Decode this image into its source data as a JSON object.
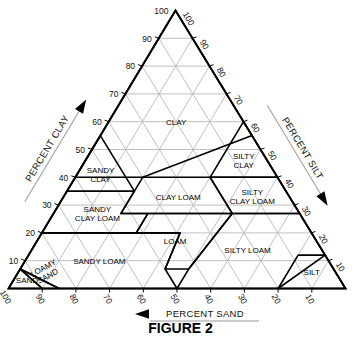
{
  "figure": {
    "caption": "FIGURE 2"
  },
  "axes": {
    "left": {
      "name": "PERCENT CLAY",
      "label": "PERCENT CLAY",
      "arrow": "up-arrow-icon",
      "ticks": [
        10,
        20,
        30,
        40,
        50,
        60,
        70,
        80,
        90,
        100
      ]
    },
    "right": {
      "name": "PERCENT SILT",
      "label": "PERCENT SILT",
      "arrow": "down-arrow-icon",
      "ticks": [
        10,
        20,
        30,
        40,
        50,
        60,
        70,
        80,
        90,
        100
      ]
    },
    "bottom": {
      "name": "PERCENT SAND",
      "label": "PERCENT SAND",
      "arrow": "left-arrow-icon",
      "ticks": [
        100,
        90,
        80,
        70,
        60,
        50,
        40,
        30,
        20,
        10
      ]
    }
  },
  "colors": {
    "outline": "#000000",
    "region_border": "#000000",
    "gridline": "#b9b9b9",
    "text": "#111111",
    "background": "#ffffff"
  },
  "chart_data": {
    "type": "diagram",
    "subtype": "ternary",
    "axis_ranges": {
      "clay": [
        0,
        100
      ],
      "silt": [
        0,
        100
      ],
      "sand": [
        0,
        100
      ]
    },
    "grid": true,
    "grid_interval": 10,
    "legend": "none",
    "classes": [
      {
        "name": "CLAY",
        "lines": [
          "CLAY"
        ],
        "centroid": {
          "clay": 60,
          "silt": 20,
          "sand": 20
        }
      },
      {
        "name": "SILTY CLAY",
        "lines": [
          "SILTY",
          "CLAY"
        ],
        "centroid": {
          "clay": 46,
          "silt": 47,
          "sand": 7
        }
      },
      {
        "name": "SANDY CLAY",
        "lines": [
          "SANDY",
          "CLAY"
        ],
        "centroid": {
          "clay": 41,
          "silt": 7,
          "sand": 52
        }
      },
      {
        "name": "CLAY LOAM",
        "lines": [
          "CLAY LOAM"
        ],
        "centroid": {
          "clay": 33,
          "silt": 34,
          "sand": 33
        }
      },
      {
        "name": "SILTY CLAY LOAM",
        "lines": [
          "SILTY",
          "CLAY LOAM"
        ],
        "centroid": {
          "clay": 33,
          "silt": 56,
          "sand": 11
        }
      },
      {
        "name": "SANDY CLAY LOAM",
        "lines": [
          "SANDY",
          "CLAY LOAM"
        ],
        "centroid": {
          "clay": 27,
          "silt": 13,
          "sand": 60
        }
      },
      {
        "name": "LOAM",
        "lines": [
          "LOAM"
        ],
        "centroid": {
          "clay": 17,
          "silt": 41,
          "sand": 42
        }
      },
      {
        "name": "SILTY LOAM",
        "lines": [
          "SILTY LOAM"
        ],
        "centroid": {
          "clay": 14,
          "silt": 64,
          "sand": 22
        }
      },
      {
        "name": "SANDY LOAM",
        "lines": [
          "SANDY LOAM"
        ],
        "centroid": {
          "clay": 10,
          "silt": 22,
          "sand": 68
        }
      },
      {
        "name": "SILT",
        "lines": [
          "SILT"
        ],
        "centroid": {
          "clay": 6,
          "silt": 87,
          "sand": 7
        }
      },
      {
        "name": "LOAMY SAND",
        "lines": [
          "LOAMY",
          "SAND"
        ],
        "centroid": {
          "clay": 6,
          "silt": 8,
          "sand": 86
        }
      },
      {
        "name": "SAND",
        "lines": [
          "SAND"
        ],
        "centroid": {
          "clay": 3,
          "silt": 4,
          "sand": 93
        }
      }
    ]
  }
}
